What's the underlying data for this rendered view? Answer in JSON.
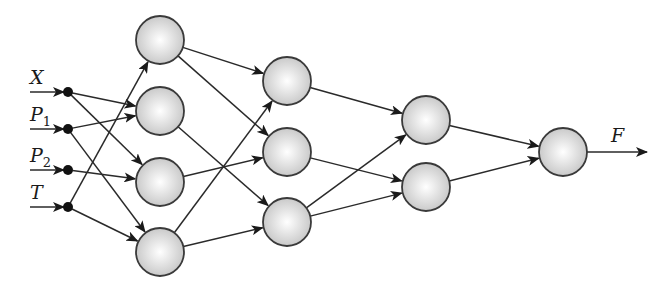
{
  "diagram": {
    "type": "neural-network",
    "inputs": [
      {
        "id": "X",
        "label": "X",
        "sub": "",
        "x": 68,
        "y": 92
      },
      {
        "id": "P1",
        "label": "P",
        "sub": "1",
        "x": 68,
        "y": 129
      },
      {
        "id": "P2",
        "label": "P",
        "sub": "2",
        "x": 68,
        "y": 170
      },
      {
        "id": "T",
        "label": "T",
        "sub": "",
        "x": 68,
        "y": 207
      }
    ],
    "layers": [
      {
        "name": "hidden-1",
        "nodes": [
          {
            "id": "h1a",
            "x": 160,
            "y": 40
          },
          {
            "id": "h1b",
            "x": 160,
            "y": 111
          },
          {
            "id": "h1c",
            "x": 160,
            "y": 182
          },
          {
            "id": "h1d",
            "x": 160,
            "y": 252
          }
        ]
      },
      {
        "name": "hidden-2",
        "nodes": [
          {
            "id": "h2a",
            "x": 287,
            "y": 81
          },
          {
            "id": "h2b",
            "x": 287,
            "y": 152
          },
          {
            "id": "h2c",
            "x": 287,
            "y": 222
          }
        ]
      },
      {
        "name": "hidden-3",
        "nodes": [
          {
            "id": "h3a",
            "x": 426,
            "y": 120
          },
          {
            "id": "h3b",
            "x": 426,
            "y": 187
          }
        ]
      },
      {
        "name": "output",
        "nodes": [
          {
            "id": "out",
            "x": 563,
            "y": 152
          }
        ]
      }
    ],
    "edges": [
      [
        "X",
        "h1b"
      ],
      [
        "X",
        "h1c"
      ],
      [
        "P1",
        "h1b"
      ],
      [
        "P1",
        "h1d"
      ],
      [
        "P2",
        "h1c"
      ],
      [
        "T",
        "h1a"
      ],
      [
        "T",
        "h1d"
      ],
      [
        "h1a",
        "h2a"
      ],
      [
        "h1a",
        "h2b"
      ],
      [
        "h1b",
        "h2c"
      ],
      [
        "h1c",
        "h2b"
      ],
      [
        "h1d",
        "h2a"
      ],
      [
        "h1d",
        "h2c"
      ],
      [
        "h2a",
        "h3a"
      ],
      [
        "h2b",
        "h3b"
      ],
      [
        "h2c",
        "h3a"
      ],
      [
        "h2c",
        "h3b"
      ],
      [
        "h3a",
        "out"
      ],
      [
        "h3b",
        "out"
      ]
    ],
    "output_label": "F",
    "node_radius": 24,
    "colors": {
      "node_fill_center": "#ffffff",
      "node_fill_edge": "#c8c8c8",
      "stroke": "#2a2a2a"
    }
  }
}
